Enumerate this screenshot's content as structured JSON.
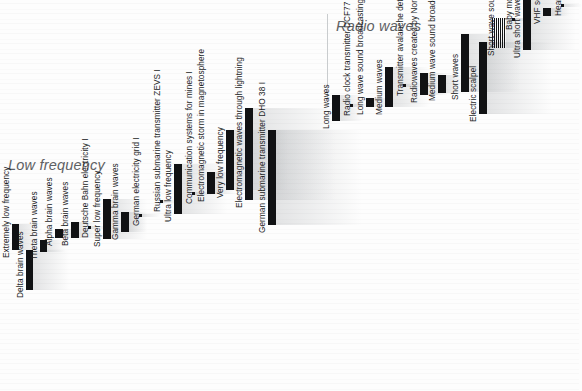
{
  "meta": {
    "accent_color": "#111214",
    "background_color": "#fdfdfd",
    "title_color": "#5e6164"
  },
  "sections": [
    {
      "id": "low-frequency",
      "title": "Low frequency"
    },
    {
      "id": "radio-waves",
      "title": "Radio waves"
    }
  ],
  "chart_data": {
    "type": "bar",
    "title": "Low frequency",
    "subtitle": "Radio waves",
    "xlabel": "",
    "ylabel": "",
    "grid": false,
    "legend": "none",
    "orientation": "vertical",
    "note": "Electromagnetic spectrum bands; bar vertical extent encodes frequency range, bar horizontal position encodes increasing frequency left to right.",
    "categories": [
      "Extremely low frequency",
      "Delta brain waves",
      "Theta brain waves",
      "Alpha brain waves",
      "Beta brain waves",
      "Deutsche Bahn electricity I",
      "Super low frequency",
      "Gamma brain waves",
      "German electricity grid I",
      "Russian submarine transmitter ZEVS I",
      "Ultra low frequency",
      "Communication systems for mines I",
      "Electromagnetic storm in magnetosphere",
      "Very low frequency",
      "Electromagnetic waves through lightning",
      "German submarine transmitter DHO 38 I",
      "Long waves",
      "Radio clock transmitter DCF77 I",
      "Long wave sound broadcasting*",
      "Medium waves",
      "Transmitter avalanche detector I",
      "Radiowaves created by Northern lights",
      "Medium wave sound broadcasting*",
      "Short waves",
      "Electric scalpel",
      "Short wave sound broadcasting*",
      "Baby monitor* I",
      "Ultra short waves",
      "VHF sound broadcasting*",
      "Hearing aids* I"
    ],
    "values": [
      26,
      40,
      12,
      9,
      16,
      3,
      40,
      20,
      3,
      3,
      50,
      3,
      22,
      60,
      92,
      95,
      26,
      3,
      9,
      40,
      3,
      22,
      18,
      58,
      72,
      30,
      3,
      50,
      8,
      3
    ]
  },
  "items": [
    {
      "label": "Extremely low frequency",
      "bar": {
        "x": 12,
        "y": 224,
        "w": 7,
        "h": 26
      },
      "label_x": 2,
      "label_y": 258
    },
    {
      "label": "Delta brain waves",
      "bar": {
        "x": 26,
        "y": 250,
        "w": 7,
        "h": 40
      },
      "label_x": 16,
      "label_y": 298
    },
    {
      "label": "Theta brain waves",
      "bar": {
        "x": 40,
        "y": 240,
        "w": 7,
        "h": 12
      },
      "label_x": 30,
      "label_y": 260
    },
    {
      "label": "Alpha brain waves",
      "bar": {
        "x": 55,
        "y": 229,
        "w": 8,
        "h": 9
      },
      "label_x": 45,
      "label_y": 246
    },
    {
      "label": "Beta brain waves",
      "bar": {
        "x": 71,
        "y": 222,
        "w": 8,
        "h": 16
      },
      "label_x": 61,
      "label_y": 246
    },
    {
      "label": "Deutsche Bahn electricity I",
      "bar": {
        "x": 88,
        "y": 226,
        "w": 3,
        "h": 3
      },
      "label_x": 81,
      "label_y": 238
    },
    {
      "label": "Super low frequency",
      "bar": {
        "x": 103,
        "y": 199,
        "w": 8,
        "h": 40
      },
      "label_x": 93,
      "label_y": 247
    },
    {
      "label": "Gamma brain waves",
      "bar": {
        "x": 121,
        "y": 212,
        "w": 8,
        "h": 20
      },
      "label_x": 111,
      "label_y": 240
    },
    {
      "label": "German electricity grid I",
      "bar": {
        "x": 139,
        "y": 214,
        "w": 3,
        "h": 3
      },
      "label_x": 132,
      "label_y": 226
    },
    {
      "label": "Russian submarine transmitter ZEVS I",
      "bar": {
        "x": 160,
        "y": 200,
        "w": 3,
        "h": 3
      },
      "label_x": 153,
      "label_y": 212
    },
    {
      "label": "Ultra low frequency",
      "bar": {
        "x": 174,
        "y": 164,
        "w": 8,
        "h": 50
      },
      "label_x": 164,
      "label_y": 222
    },
    {
      "label": "Communication systems for mines I",
      "bar": {
        "x": 192,
        "y": 192,
        "w": 3,
        "h": 3
      },
      "label_x": 185,
      "label_y": 204
    },
    {
      "label": "Electromagnetic storm in magnetosphere",
      "bar": {
        "x": 207,
        "y": 172,
        "w": 8,
        "h": 22
      },
      "label_x": 197,
      "label_y": 202
    },
    {
      "label": "Very low frequency",
      "bar": {
        "x": 226,
        "y": 130,
        "w": 8,
        "h": 60
      },
      "label_x": 216,
      "label_y": 198
    },
    {
      "label": "Electromagnetic waves through lightning",
      "bar": {
        "x": 245,
        "y": 108,
        "w": 8,
        "h": 92
      },
      "label_x": 235,
      "label_y": 208
    },
    {
      "label": "German submarine transmitter DHO 38 I",
      "bar": {
        "x": 268,
        "y": 130,
        "w": 8,
        "h": 95
      },
      "label_x": 258,
      "label_y": 233
    },
    {
      "label": "Long waves",
      "bar": {
        "x": 332,
        "y": 95,
        "w": 8,
        "h": 26
      },
      "label_x": 322,
      "label_y": 129
    },
    {
      "label": "Radio clock transmitter DCF77 I",
      "bar": {
        "x": 350,
        "y": 104,
        "w": 3,
        "h": 3
      },
      "label_x": 343,
      "label_y": 116
    },
    {
      "label": "Long wave sound broadcasting*",
      "bar": {
        "x": 366,
        "y": 98,
        "w": 8,
        "h": 9
      },
      "label_x": 356,
      "label_y": 115
    },
    {
      "label": "Medium waves",
      "bar": {
        "x": 385,
        "y": 67,
        "w": 8,
        "h": 40
      },
      "label_x": 375,
      "label_y": 115
    },
    {
      "label": "Transmitter avalanche detector I",
      "bar": {
        "x": 403,
        "y": 84,
        "w": 3,
        "h": 3
      },
      "label_x": 396,
      "label_y": 96
    },
    {
      "label": "Radiowaves created by Northern lights",
      "bar": {
        "x": 420,
        "y": 73,
        "w": 8,
        "h": 22
      },
      "label_x": 410,
      "label_y": 103
    },
    {
      "label": "Medium wave sound broadcasting*",
      "bar": {
        "x": 438,
        "y": 75,
        "w": 8,
        "h": 18
      },
      "label_x": 428,
      "label_y": 101
    },
    {
      "label": "Short waves",
      "bar": {
        "x": 461,
        "y": 34,
        "w": 8,
        "h": 58
      },
      "label_x": 451,
      "label_y": 100
    },
    {
      "label": "Electric scalpel",
      "bar": {
        "x": 479,
        "y": 42,
        "w": 8,
        "h": 72
      },
      "label_x": 469,
      "label_y": 122
    },
    {
      "label": "Short wave sound broadcasting*",
      "bar": {
        "x": 492,
        "y": 18,
        "w": 14,
        "h": 30
      },
      "label_x": 487,
      "label_y": 56,
      "striped": true
    },
    {
      "label": "Baby monitor* I",
      "bar": {
        "x": 512,
        "y": 18,
        "w": 3,
        "h": 3
      },
      "label_x": 505,
      "label_y": 30
    },
    {
      "label": "Ultra short waves",
      "bar": {
        "x": 523,
        "y": 0,
        "w": 8,
        "h": 50
      },
      "label_x": 513,
      "label_y": 58
    },
    {
      "label": "VHF sound broadcasting*",
      "bar": {
        "x": 543,
        "y": 8,
        "w": 8,
        "h": 8
      },
      "label_x": 533,
      "label_y": 24
    },
    {
      "label": "Hearing aids* I",
      "bar": {
        "x": 561,
        "y": 4,
        "w": 3,
        "h": 3
      },
      "label_x": 554,
      "label_y": 16
    }
  ]
}
